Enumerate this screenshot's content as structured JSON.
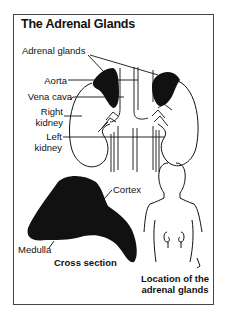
{
  "title": "The Adrenal Glands",
  "labels": {
    "adrenal_glands": "Adrenal glands",
    "aorta": "Aorta",
    "vena_cava": "Vena cava",
    "right_kidney_1": "Right",
    "right_kidney_2": "kidney",
    "left_kidney_1": "Left",
    "left_kidney_2": "kidney",
    "cortex": "Cortex",
    "medulla": "Medulla",
    "cross_section": "Cross section",
    "location_1": "Location of the",
    "location_2": "adrenal glands"
  },
  "colors": {
    "ink": "#111111",
    "frame": "#444444",
    "background": "#ffffff"
  }
}
